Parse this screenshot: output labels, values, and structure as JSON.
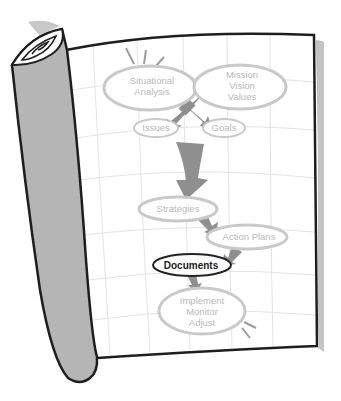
{
  "diagram": {
    "colors": {
      "outline": "#1e1e1e",
      "scroll_fill": "#b5b5b5",
      "grid": "#e2e2e2",
      "node_stroke": "#c9c9c9",
      "node_text": "#b8b8b8",
      "arrow": "#8f8f8f",
      "active_stroke": "#222222",
      "active_text": "#222222"
    },
    "nodes": [
      {
        "id": "situational-analysis",
        "lines": [
          "Situational",
          "Analysis"
        ],
        "active": false
      },
      {
        "id": "mission-vision-values",
        "lines": [
          "Mission",
          "Vision",
          "Values"
        ],
        "active": false
      },
      {
        "id": "issues",
        "lines": [
          "Issues"
        ],
        "active": false
      },
      {
        "id": "goals",
        "lines": [
          "Goals"
        ],
        "active": false
      },
      {
        "id": "strategies",
        "lines": [
          "Strategies"
        ],
        "active": false
      },
      {
        "id": "action-plans",
        "lines": [
          "Action Plans"
        ],
        "active": false
      },
      {
        "id": "documents",
        "lines": [
          "Documents"
        ],
        "active": true
      },
      {
        "id": "implement-monitor-adjust",
        "lines": [
          "Implement",
          "Monitor",
          "Adjust"
        ],
        "active": false
      }
    ],
    "edges": [
      {
        "from": "situational-analysis",
        "to": "goals"
      },
      {
        "from": "mission-vision-values",
        "to": "issues"
      },
      {
        "from": "issues",
        "to": "strategies"
      },
      {
        "from": "strategies",
        "to": "action-plans"
      },
      {
        "from": "action-plans",
        "to": "documents"
      },
      {
        "from": "documents",
        "to": "implement-monitor-adjust"
      }
    ]
  }
}
